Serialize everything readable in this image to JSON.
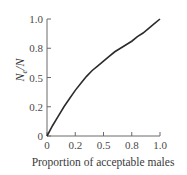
{
  "chart_data": {
    "type": "line",
    "title": "",
    "xlabel": "Proportion of acceptable males",
    "ylabel": "Ne/N",
    "ylabel_main": "N",
    "ylabel_sub": "e",
    "ylabel_tail": "/N",
    "xlim": [
      0,
      1.0
    ],
    "ylim": [
      0,
      1.0
    ],
    "x_ticks": [
      0,
      0.25,
      0.5,
      0.75,
      1.0
    ],
    "x_tick_labels": [
      "0",
      "0.2",
      "0.5",
      "0.8",
      "1.0"
    ],
    "y_ticks": [
      0,
      0.25,
      0.5,
      0.75,
      1.0
    ],
    "y_tick_labels": [
      "0",
      "0.2",
      "0.5",
      "0.8",
      "1.0"
    ],
    "grid": false,
    "legend": null,
    "series": [
      {
        "name": "Ne/N",
        "x": [
          0,
          0.05,
          0.1,
          0.15,
          0.2,
          0.25,
          0.3,
          0.35,
          0.4,
          0.45,
          0.5,
          0.55,
          0.6,
          0.65,
          0.7,
          0.75,
          0.8,
          0.85,
          0.9,
          0.95,
          1.0
        ],
        "y": [
          0,
          0.09,
          0.17,
          0.25,
          0.32,
          0.39,
          0.45,
          0.51,
          0.56,
          0.6,
          0.64,
          0.68,
          0.72,
          0.75,
          0.78,
          0.81,
          0.85,
          0.88,
          0.92,
          0.96,
          1.0
        ]
      }
    ],
    "color": "#2b2b2b"
  }
}
